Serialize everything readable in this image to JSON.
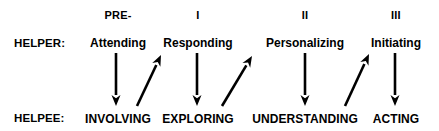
{
  "diagram": {
    "width": 439,
    "height": 131,
    "background_color": "#ffffff",
    "ink_color": "#000000"
  },
  "row_labels": {
    "helper": "HELPER:",
    "helpee": "HELPEE:"
  },
  "phases": [
    {
      "number": "PRE-",
      "helper_stage": "Attending",
      "helpee_stage": "INVOLVING",
      "x": 118
    },
    {
      "number": "I",
      "helper_stage": "Responding",
      "helpee_stage": "EXPLORING",
      "x": 198
    },
    {
      "number": "II",
      "helper_stage": "Personalizing",
      "helpee_stage": "UNDERSTANDING",
      "x": 305
    },
    {
      "number": "III",
      "helper_stage": "Initiating",
      "helpee_stage": "ACTING",
      "x": 396
    }
  ],
  "arrows": {
    "down": [
      {
        "name": "attending-to-involving",
        "x": 116,
        "y1": 53,
        "y2": 106
      },
      {
        "name": "responding-to-exploring",
        "x": 197,
        "y1": 53,
        "y2": 106
      },
      {
        "name": "personalizing-to-understanding",
        "x": 305,
        "y1": 53,
        "y2": 106
      },
      {
        "name": "initiating-to-acting",
        "x": 395,
        "y1": 53,
        "y2": 106
      }
    ],
    "diagonal": [
      {
        "name": "involving-to-responding",
        "x1": 137,
        "y1": 106,
        "x2": 161,
        "y2": 55
      },
      {
        "name": "exploring-to-personalizing",
        "x1": 222,
        "y1": 106,
        "x2": 252,
        "y2": 56
      },
      {
        "name": "understanding-to-initiating",
        "x1": 345,
        "y1": 106,
        "x2": 369,
        "y2": 54
      }
    ]
  }
}
